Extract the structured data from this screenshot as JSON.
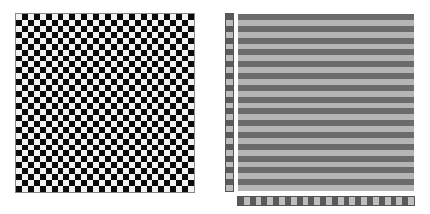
{
  "left_panel": {
    "label": "checkerboard",
    "grid_size": 30,
    "colors": {
      "light": "#f2f2f2",
      "dark": "#0a0a0a"
    },
    "first_cell": "light"
  },
  "right_panel": {
    "label": "striped-grid",
    "rows": 30,
    "colors": {
      "stripe_dark": "#6b6b6b",
      "stripe_light": "#b5b5b5",
      "strip_dark": "#5a5a5a",
      "strip_light": "#bdbdbd"
    },
    "first_stripe": "dark",
    "left_strip_cells": 30,
    "bottom_strip_cells": 30
  }
}
